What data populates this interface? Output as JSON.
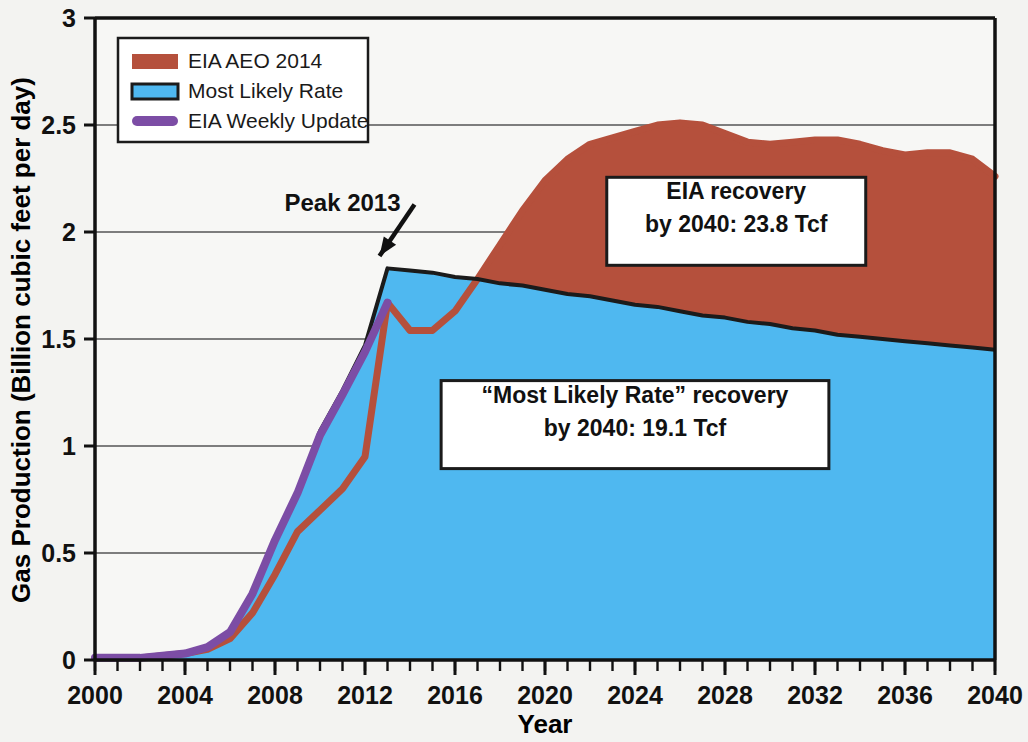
{
  "chart_data": {
    "type": "area",
    "title": "",
    "xlabel": "Year",
    "ylabel": "Gas Production (Billion cubic feet per day)",
    "xlim": [
      2000,
      2040
    ],
    "ylim": [
      0,
      3
    ],
    "xticks": [
      "2000",
      "2004",
      "2008",
      "2012",
      "2016",
      "2020",
      "2024",
      "2028",
      "2032",
      "2036",
      "2040"
    ],
    "xtick_values": [
      2000,
      2004,
      2008,
      2012,
      2016,
      2020,
      2024,
      2028,
      2032,
      2036,
      2040
    ],
    "yticks": [
      "0",
      "0.5",
      "1",
      "1.5",
      "2",
      "2.5",
      "3"
    ],
    "ytick_values": [
      0,
      0.5,
      1,
      1.5,
      2,
      2.5,
      3
    ],
    "grid": "horizontal",
    "minor_x_tick_step": 1,
    "legend_position": "top-left",
    "legend": [
      {
        "label": "EIA AEO 2014",
        "type": "area",
        "color": "#b5503c"
      },
      {
        "label": "Most Likely Rate",
        "type": "area",
        "color": "#4fb8f0",
        "edge": "#1b1b1b"
      },
      {
        "label": "EIA Weekly Update",
        "type": "line",
        "color": "#7c4da5"
      }
    ],
    "series": [
      {
        "name": "EIA AEO 2014",
        "color": "#b5503c",
        "x": [
          2000,
          2001,
          2002,
          2003,
          2004,
          2005,
          2006,
          2007,
          2008,
          2009,
          2010,
          2011,
          2012,
          2013,
          2014,
          2015,
          2016,
          2017,
          2018,
          2019,
          2020,
          2021,
          2022,
          2023,
          2024,
          2025,
          2026,
          2027,
          2028,
          2029,
          2030,
          2031,
          2032,
          2033,
          2034,
          2035,
          2036,
          2037,
          2038,
          2039,
          2040
        ],
        "values": [
          0.01,
          0.01,
          0.01,
          0.02,
          0.03,
          0.05,
          0.1,
          0.22,
          0.4,
          0.6,
          0.7,
          0.8,
          0.95,
          1.67,
          1.54,
          1.54,
          1.63,
          1.78,
          1.94,
          2.1,
          2.24,
          2.34,
          2.41,
          2.44,
          2.47,
          2.5,
          2.51,
          2.5,
          2.46,
          2.42,
          2.41,
          2.42,
          2.43,
          2.43,
          2.41,
          2.38,
          2.36,
          2.37,
          2.37,
          2.34,
          2.26
        ]
      },
      {
        "name": "Most Likely Rate",
        "color": "#4fb8f0",
        "edge_color": "#1b1b1b",
        "x": [
          2000,
          2001,
          2002,
          2003,
          2004,
          2005,
          2006,
          2007,
          2008,
          2009,
          2010,
          2011,
          2012,
          2013,
          2014,
          2015,
          2016,
          2017,
          2018,
          2019,
          2020,
          2021,
          2022,
          2023,
          2024,
          2025,
          2026,
          2027,
          2028,
          2029,
          2030,
          2031,
          2032,
          2033,
          2034,
          2035,
          2036,
          2037,
          2038,
          2039,
          2040
        ],
        "values": [
          0.01,
          0.01,
          0.01,
          0.02,
          0.03,
          0.06,
          0.13,
          0.31,
          0.56,
          0.78,
          1.07,
          1.26,
          1.47,
          1.83,
          1.82,
          1.81,
          1.79,
          1.78,
          1.76,
          1.75,
          1.73,
          1.71,
          1.7,
          1.68,
          1.66,
          1.65,
          1.63,
          1.61,
          1.6,
          1.58,
          1.57,
          1.55,
          1.54,
          1.52,
          1.51,
          1.5,
          1.49,
          1.48,
          1.47,
          1.46,
          1.45
        ]
      },
      {
        "name": "EIA Weekly Update",
        "color": "#7c4da5",
        "x": [
          2000,
          2001,
          2002,
          2003,
          2004,
          2005,
          2006,
          2007,
          2008,
          2009,
          2010,
          2011,
          2012,
          2013
        ],
        "values": [
          0.01,
          0.01,
          0.01,
          0.02,
          0.03,
          0.06,
          0.13,
          0.31,
          0.56,
          0.78,
          1.05,
          1.24,
          1.44,
          1.67
        ]
      }
    ],
    "annotations": [
      {
        "name": "peak-2013",
        "text": "Peak 2013",
        "x": 2011.0,
        "y": 2.1,
        "arrow_to_x": 2013,
        "arrow_to_y": 1.86
      },
      {
        "name": "eia-recovery",
        "lines": [
          "EIA recovery",
          "by 2040: 23.8 Tcf"
        ],
        "x": 2028.5,
        "y": 2.05
      },
      {
        "name": "most-likely-recovery",
        "lines": [
          "“Most Likely Rate” recovery",
          "by 2040: 19.1 Tcf"
        ],
        "x": 2024.0,
        "y": 1.1
      }
    ]
  }
}
